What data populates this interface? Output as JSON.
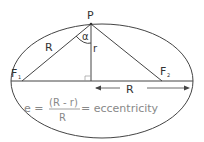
{
  "diagram": {
    "labels": {
      "point": "P",
      "angle": "α",
      "side_left": "R",
      "height": "r",
      "focus1": "F",
      "focus1_sub": "1",
      "focus2": "F",
      "focus2_sub": "2",
      "semi_axis": "R"
    },
    "formula": {
      "lhs": "e =",
      "numerator": "(R - r)",
      "denominator": "R",
      "rhs": "= eccentricity"
    },
    "colors": {
      "stroke": "#444444",
      "text": "#333333",
      "formula": "#8a8a8a"
    }
  }
}
